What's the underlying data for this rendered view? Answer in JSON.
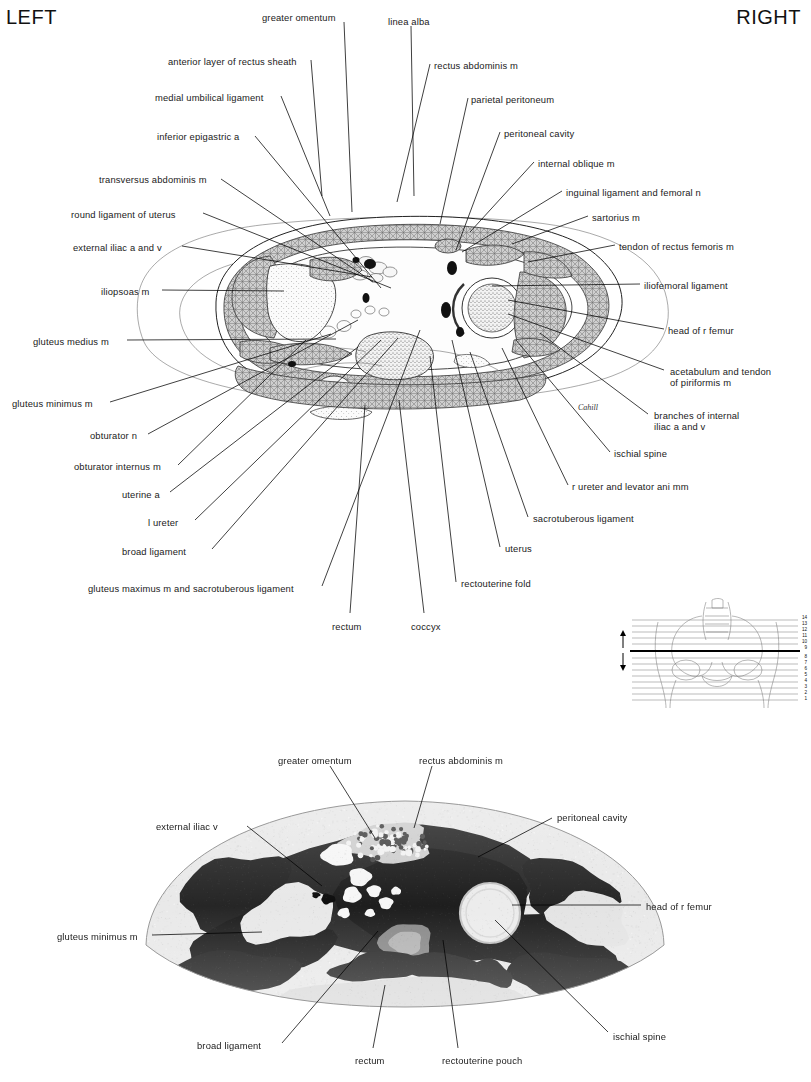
{
  "header": {
    "left": "LEFT",
    "right": "RIGHT"
  },
  "signature": "Cahill",
  "top_figure": {
    "type": "anatomical cross-section drawing of female pelvis",
    "labels_left": [
      {
        "text": "anterior layer of rectus sheath",
        "x": 168,
        "y": 56
      },
      {
        "text": "medial umbilical ligament",
        "x": 155,
        "y": 92
      },
      {
        "text": "inferior epigastric a",
        "x": 157,
        "y": 131
      },
      {
        "text": "transversus abdominis m",
        "x": 99,
        "y": 174
      },
      {
        "text": "round ligament of uterus",
        "x": 71,
        "y": 209
      },
      {
        "text": "external iliac a and v",
        "x": 73,
        "y": 242
      },
      {
        "text": "iliopsoas m",
        "x": 101,
        "y": 286
      },
      {
        "text": "gluteus medius m",
        "x": 33,
        "y": 336
      },
      {
        "text": "gluteus minimus m",
        "x": 12,
        "y": 398
      },
      {
        "text": "obturator n",
        "x": 90,
        "y": 430
      },
      {
        "text": "obturator internus m",
        "x": 74,
        "y": 461
      },
      {
        "text": "uterine a",
        "x": 122,
        "y": 489
      },
      {
        "text": "l ureter",
        "x": 148,
        "y": 517
      },
      {
        "text": "broad ligament",
        "x": 122,
        "y": 546
      },
      {
        "text": "gluteus maximus m and sacrotuberous ligament",
        "x": 88,
        "y": 583
      }
    ],
    "labels_top": [
      {
        "text": "greater omentum",
        "x": 262,
        "y": 12
      },
      {
        "text": "linea alba",
        "x": 388,
        "y": 16
      }
    ],
    "labels_right": [
      {
        "text": "rectus abdominis m",
        "x": 434,
        "y": 60
      },
      {
        "text": "parietal peritoneum",
        "x": 471,
        "y": 94
      },
      {
        "text": "peritoneal cavity",
        "x": 504,
        "y": 128
      },
      {
        "text": "internal oblique m",
        "x": 538,
        "y": 158
      },
      {
        "text": "inguinal ligament and femoral n",
        "x": 566,
        "y": 187
      },
      {
        "text": "sartorius m",
        "x": 592,
        "y": 212
      },
      {
        "text": "tendon of rectus femoris m",
        "x": 619,
        "y": 241
      },
      {
        "text": "iliofemoral ligament",
        "x": 644,
        "y": 280
      },
      {
        "text": "head of r femur",
        "x": 668,
        "y": 325
      },
      {
        "text": "acetabulum and tendon of piriformis m",
        "x": 670,
        "y": 366
      },
      {
        "text": "branches of internal iliac a and v",
        "x": 654,
        "y": 410
      },
      {
        "text": "ischial spine",
        "x": 614,
        "y": 448
      },
      {
        "text": "r ureter and levator ani mm",
        "x": 572,
        "y": 481
      },
      {
        "text": "sacrotuberous ligament",
        "x": 533,
        "y": 513
      },
      {
        "text": "uterus",
        "x": 505,
        "y": 543
      },
      {
        "text": "rectouterine fold",
        "x": 461,
        "y": 578
      }
    ],
    "labels_bottom": [
      {
        "text": "rectum",
        "x": 332,
        "y": 621
      },
      {
        "text": "coccyx",
        "x": 411,
        "y": 621
      }
    ]
  },
  "key_diagram": {
    "description": "pelvis outline with numbered section levels",
    "levels": [
      "14",
      "13",
      "12",
      "11",
      "10",
      "9",
      "8",
      "7",
      "6",
      "5",
      "4",
      "3",
      "2",
      "1"
    ],
    "current_level": "9",
    "side_caption": "Hamstring Anatomy"
  },
  "bottom_figure": {
    "type": "cross-section photograph",
    "labels": [
      {
        "text": "greater omentum",
        "x": 278,
        "y": 755
      },
      {
        "text": "rectus abdominis m",
        "x": 419,
        "y": 755
      },
      {
        "text": "external iliac v",
        "x": 156,
        "y": 821
      },
      {
        "text": "peritoneal cavity",
        "x": 557,
        "y": 812
      },
      {
        "text": "head of r femur",
        "x": 646,
        "y": 901
      },
      {
        "text": "gluteus minimus m",
        "x": 57,
        "y": 931
      },
      {
        "text": "broad ligament",
        "x": 197,
        "y": 1040
      },
      {
        "text": "rectum",
        "x": 355,
        "y": 1055
      },
      {
        "text": "rectouterine pouch",
        "x": 442,
        "y": 1055
      },
      {
        "text": "ischial spine",
        "x": 613,
        "y": 1031
      }
    ]
  },
  "colors": {
    "ink": "#000000",
    "leader": "#000000",
    "outline": "#777777"
  }
}
